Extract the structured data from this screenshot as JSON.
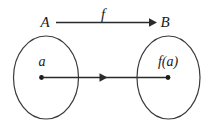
{
  "figure": {
    "background_color": "#ffffff",
    "stroke_color": "#2b2b2b",
    "label_color": "#1a1a1a",
    "top_row": {
      "domain_label": "A",
      "function_label": "f",
      "codomain_label": "B",
      "arrow_direction": "right"
    },
    "left_set": {
      "name": "domain-set",
      "element_label": "a",
      "dot": true
    },
    "right_set": {
      "name": "codomain-set",
      "element_label": "f(a)",
      "dot": true
    },
    "mapping_arrow": {
      "from": "a",
      "to": "f(a)",
      "direction": "right"
    }
  }
}
